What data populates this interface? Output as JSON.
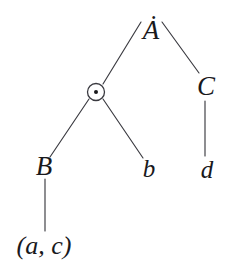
{
  "figure": {
    "type": "tree-diagram",
    "width": 235,
    "height": 278,
    "background": "#ffffff",
    "stroke_color": "#3a3a40",
    "text_color": "#19191c"
  },
  "nodes": {
    "root": {
      "id": "A-dot",
      "label": "A",
      "accent": "dot-above",
      "display": "Ȧ",
      "x": 151,
      "y": 30
    },
    "circle_dot": {
      "id": "circle-dot-operator",
      "label": "⊙",
      "icon": "circled-dot-icon",
      "x": 96,
      "y": 92,
      "radius": 8.5,
      "inner_radius": 2
    },
    "c": {
      "id": "C",
      "label": "C",
      "x": 206,
      "y": 86
    },
    "b_upper": {
      "id": "B",
      "label": "B",
      "x": 44,
      "y": 166
    },
    "b_lower": {
      "id": "b",
      "label": "b",
      "x": 149,
      "y": 168
    },
    "d": {
      "id": "d",
      "label": "d",
      "x": 207,
      "y": 169
    },
    "tuple": {
      "id": "a-c-tuple",
      "label": "(a, c)",
      "x": 44,
      "y": 246
    }
  },
  "edges": [
    {
      "id": "edge-root-to-circle",
      "from": "A-dot",
      "to": "circle-dot-operator",
      "x1": 141,
      "y1": 22,
      "x2": 103,
      "y2": 84
    },
    {
      "id": "edge-root-to-C",
      "from": "A-dot",
      "to": "C",
      "x1": 162,
      "y1": 22,
      "x2": 199,
      "y2": 73
    },
    {
      "id": "edge-circle-to-B",
      "from": "circle-dot-operator",
      "to": "B",
      "x1": 89,
      "y1": 99,
      "x2": 50,
      "y2": 157
    },
    {
      "id": "edge-circle-to-b",
      "from": "circle-dot-operator",
      "to": "b",
      "x1": 103,
      "y1": 99,
      "x2": 143,
      "y2": 158
    },
    {
      "id": "edge-C-to-d",
      "from": "C",
      "to": "d",
      "x1": 205,
      "y1": 101,
      "x2": 205,
      "y2": 156
    },
    {
      "id": "edge-B-to-tuple",
      "from": "B",
      "to": "a-c-tuple",
      "x1": 45,
      "y1": 179,
      "x2": 45,
      "y2": 231
    }
  ]
}
